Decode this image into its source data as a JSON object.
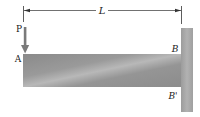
{
  "diagram": {
    "type": "cantilever-beam",
    "labels": {
      "length": "L",
      "force": "P",
      "free_end": "A",
      "fixed_top": "B",
      "fixed_bottom": "B'"
    },
    "colors": {
      "beam": "#8c8c8c",
      "beam_light": "#b4b4b4",
      "wall": "#a6a6a6",
      "arrow": "#7a7a7a",
      "line": "#333333"
    }
  }
}
